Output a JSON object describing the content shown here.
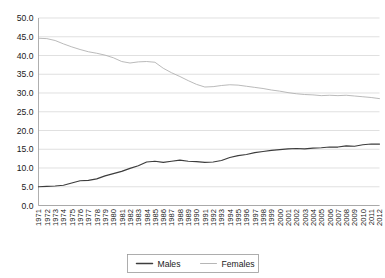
{
  "chart_data": {
    "type": "line",
    "title": "",
    "xlabel": "",
    "ylabel": "",
    "ylim": [
      0.0,
      50.0
    ],
    "ytick_step": 5.0,
    "grid": true,
    "legend_position": "bottom",
    "ytick_labels": [
      "0.0",
      "5.0",
      "10.0",
      "15.0",
      "20.0",
      "25.0",
      "30.0",
      "35.0",
      "40.0",
      "45.0",
      "50.0"
    ],
    "ytick_values": [
      0.0,
      5.0,
      10.0,
      15.0,
      20.0,
      25.0,
      30.0,
      35.0,
      40.0,
      45.0,
      50.0
    ],
    "categories": [
      "1971",
      "1972",
      "1973",
      "1974",
      "1975",
      "1976",
      "1977",
      "1978",
      "1979",
      "1980",
      "1981",
      "1982",
      "1983",
      "1984",
      "1985",
      "1986",
      "1987",
      "1988",
      "1989",
      "1990",
      "1991",
      "1992",
      "1993",
      "1994",
      "1995",
      "1996",
      "1997",
      "1998",
      "1999",
      "2000",
      "2001",
      "2002",
      "2003",
      "2004",
      "2005",
      "2006",
      "2007",
      "2008",
      "2009",
      "2010",
      "2011",
      "2012"
    ],
    "series": [
      {
        "name": "Males",
        "color": "#3d3d3d",
        "values": [
          5.0,
          5.1,
          5.2,
          5.4,
          6.0,
          6.6,
          6.7,
          7.1,
          7.9,
          8.5,
          9.1,
          9.9,
          10.6,
          11.6,
          11.8,
          11.5,
          11.8,
          12.1,
          11.8,
          11.7,
          11.5,
          11.6,
          12.0,
          12.8,
          13.3,
          13.6,
          14.1,
          14.4,
          14.7,
          14.9,
          15.1,
          15.2,
          15.1,
          15.3,
          15.4,
          15.6,
          15.6,
          15.9,
          15.8,
          16.2,
          16.4,
          16.4
        ]
      },
      {
        "name": "Females",
        "color": "#aeaeae",
        "values": [
          44.6,
          44.5,
          44.0,
          43.1,
          42.3,
          41.6,
          41.0,
          40.6,
          40.1,
          39.4,
          38.4,
          38.0,
          38.3,
          38.4,
          38.2,
          36.6,
          35.4,
          34.4,
          33.3,
          32.3,
          31.6,
          31.7,
          32.0,
          32.2,
          32.1,
          31.8,
          31.5,
          31.2,
          30.8,
          30.5,
          30.1,
          29.8,
          29.6,
          29.5,
          29.3,
          29.4,
          29.3,
          29.4,
          29.2,
          29.0,
          28.8,
          28.5
        ]
      }
    ]
  },
  "legend": {
    "items": [
      {
        "label": "Males",
        "color": "#3d3d3d",
        "weight": "thick"
      },
      {
        "label": "Females",
        "color": "#aeaeae",
        "weight": "thin"
      }
    ]
  }
}
